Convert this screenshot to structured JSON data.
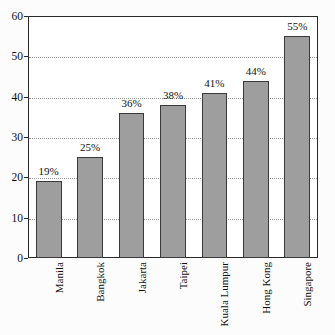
{
  "chart_data": {
    "type": "bar",
    "title": "",
    "subtitle": "",
    "xlabel": "",
    "ylabel": "",
    "categories": [
      "Manila",
      "Bangkok",
      "Jakarta",
      "Taipei",
      "Kuala Lumpur",
      "Hong Kong",
      "Singapore"
    ],
    "values": [
      19,
      25,
      36,
      38,
      41,
      44,
      55
    ],
    "data_labels": [
      "19%",
      "25%",
      "36%",
      "38%",
      "41%",
      "44%",
      "55%"
    ],
    "ylim": [
      0,
      60
    ],
    "yticks": [
      0,
      10,
      20,
      30,
      40,
      50,
      60
    ],
    "ytick_labels": [
      "0",
      "10",
      "20",
      "30",
      "40",
      "50",
      "60"
    ],
    "grid": true,
    "grid_axis": "y",
    "grid_style": "dotted",
    "legend": false,
    "legend_position": "none",
    "bar_color": "#9e9e9e",
    "bar_edge_color": "#3a3a3a",
    "axis_color": "#2a2a2a",
    "grid_color": "#9a9a9a",
    "background_color": "#fcfcfd",
    "plot_background_color": "#ffffff",
    "xtick_label_rotation": 90
  }
}
